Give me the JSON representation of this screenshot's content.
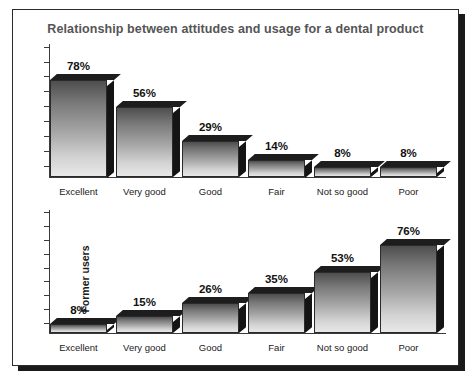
{
  "chart_data": {
    "type": "bar",
    "title": "Relationship between attitudes and usage for a dental product",
    "categories": [
      "Excellent",
      "Very good",
      "Good",
      "Fair",
      "Not so good",
      "Poor"
    ],
    "xlabel": "",
    "ylabel": "",
    "ylim": [
      0,
      100
    ],
    "grid": false,
    "legend": "none",
    "axis_tick_labels": [],
    "value_suffix": "%",
    "panels": [
      {
        "ylabel": "Current users",
        "values": [
          78,
          56,
          29,
          14,
          8,
          8
        ],
        "value_labels": [
          "78%",
          "56%",
          "29%",
          "14%",
          "8%",
          "8%"
        ]
      },
      {
        "ylabel": "Former users",
        "values": [
          8,
          15,
          26,
          35,
          53,
          76
        ],
        "value_labels": [
          "8%",
          "15%",
          "26%",
          "35%",
          "53%",
          "76%"
        ]
      }
    ]
  },
  "colors": {
    "frame_border": "#2b2b2b",
    "frame_shadow": "#1a1a1a",
    "title_text": "#555555",
    "axis": "#3a3a3a",
    "bar_dark": "#4e4e4e",
    "bar_light": "#e8e8e8",
    "bar_depth": "#141414",
    "label_text": "#121212"
  }
}
